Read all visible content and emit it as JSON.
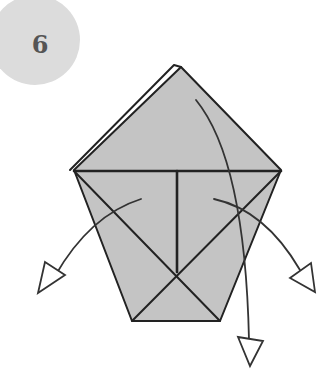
{
  "step": {
    "number": "6",
    "badge_color": "#dcdcdc",
    "number_color": "#555555"
  },
  "diagram": {
    "paper_fill": "#c4c4c4",
    "line_color": "#222222",
    "arrows": [
      {
        "name": "left-flap-arrow",
        "direction": "down-left"
      },
      {
        "name": "right-flap-arrow",
        "direction": "down-right"
      },
      {
        "name": "top-flap-arrow",
        "direction": "down"
      }
    ]
  }
}
